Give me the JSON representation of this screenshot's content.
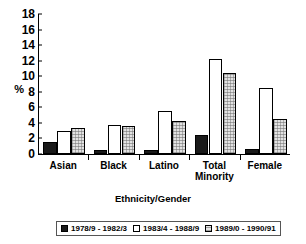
{
  "chart_data": {
    "type": "bar",
    "title": "",
    "xlabel": "Ethnicity/Gender",
    "ylabel": "%",
    "ylim": [
      0,
      18
    ],
    "ytick_step": 2,
    "yticks": [
      "18",
      "16",
      "14",
      "12",
      "10",
      "8",
      "6",
      "4",
      "2",
      "0"
    ],
    "grid": false,
    "legend_position": "bottom",
    "categories": [
      "Asian",
      "Black",
      "Latino",
      "Total Minority",
      "Female"
    ],
    "category_lines": [
      [
        "Asian"
      ],
      [
        "Black"
      ],
      [
        "Latino"
      ],
      [
        "Total",
        "Minority"
      ]
    ],
    "series": [
      {
        "name": "1978/9 - 1982/3",
        "color": "#1a1a1a",
        "fill": "solid-black",
        "values": [
          1.5,
          0.5,
          0.5,
          2.5,
          0.7
        ]
      },
      {
        "name": "1983/4 - 1988/9",
        "color": "#ffffff",
        "fill": "white",
        "values": [
          3.0,
          3.7,
          5.5,
          12.2,
          8.5
        ]
      },
      {
        "name": "1989/0 - 1990/91",
        "color": "#e2e2e2",
        "fill": "light-gray-stipple",
        "values": [
          3.3,
          3.6,
          4.3,
          10.4,
          4.5
        ]
      }
    ]
  },
  "axis": {
    "y_label": "%",
    "x_label": "Ethnicity/Gender"
  },
  "legend": {
    "items": [
      {
        "label": "1978/9 - 1982/3"
      },
      {
        "label": "1983/4 - 1988/9"
      },
      {
        "label": "1989/0 - 1990/91"
      }
    ]
  }
}
